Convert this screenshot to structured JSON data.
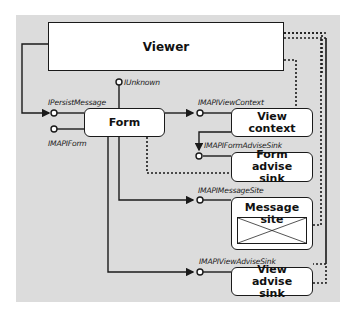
{
  "diagram": {
    "components": {
      "viewer": "Viewer",
      "form": "Form",
      "view_context": "View context",
      "form_advise_sink": "Form advise sink",
      "message_site": "Message site",
      "view_advise_sink": "View advise sink"
    },
    "interfaces": {
      "iunknown": "IUnknown",
      "ipersistmessage": "IPersistMessage",
      "imapiform": "IMAPIForm",
      "imapiviewcontext": "IMAPIViewContext",
      "imapiformadvisesink": "IMAPIFormAdviseSink",
      "imapimessagesite": "IMAPIMessageSite",
      "imapiviewadvisesink": "IMAPIViewAdviseSink"
    },
    "colors": {
      "panel": "#dcdcdc",
      "box_fill": "#ffffff",
      "line": "#1a1a1a"
    }
  }
}
